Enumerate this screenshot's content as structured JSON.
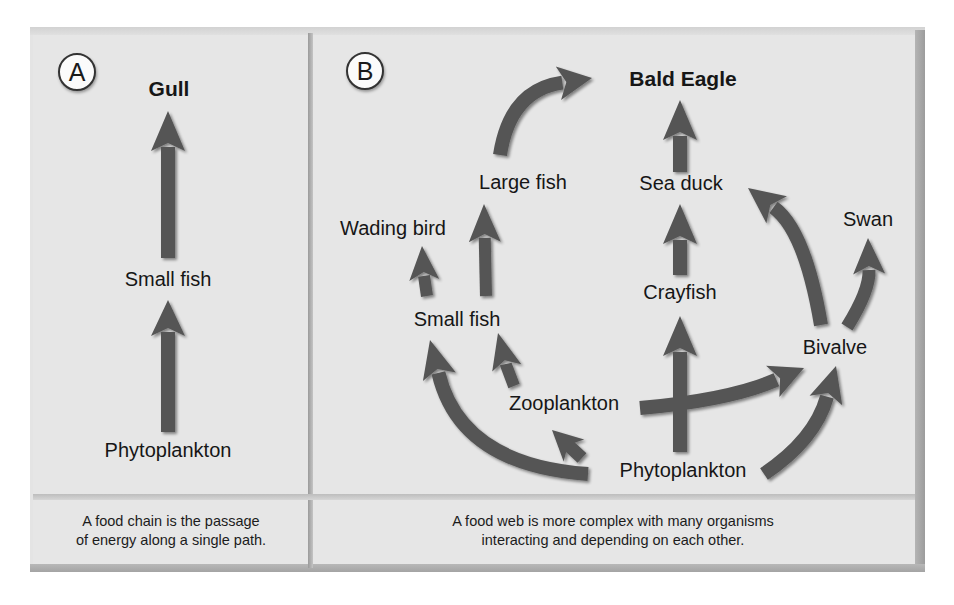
{
  "figure": {
    "panel_a": {
      "badge": "A",
      "top_consumer": "Gull",
      "nodes": [
        "Gull",
        "Small fish",
        "Phytoplankton"
      ],
      "links": [
        {
          "from": "Phytoplankton",
          "to": "Small fish"
        },
        {
          "from": "Small fish",
          "to": "Gull"
        }
      ],
      "caption_line1": "A food chain is the passage",
      "caption_line2": "of energy along a single path."
    },
    "panel_b": {
      "badge": "B",
      "nodes": {
        "bald_eagle": "Bald Eagle",
        "large_fish": "Large fish",
        "sea_duck": "Sea duck",
        "wading_bird": "Wading bird",
        "swan": "Swan",
        "crayfish": "Crayfish",
        "small_fish": "Small fish",
        "bivalve": "Bivalve",
        "zooplankton": "Zooplankton",
        "phytoplankton": "Phytoplankton"
      },
      "links": [
        {
          "from": "Large fish",
          "to": "Bald Eagle"
        },
        {
          "from": "Sea duck",
          "to": "Bald Eagle"
        },
        {
          "from": "Small fish",
          "to": "Large fish"
        },
        {
          "from": "Small fish",
          "to": "Wading bird"
        },
        {
          "from": "Crayfish",
          "to": "Sea duck"
        },
        {
          "from": "Bivalve",
          "to": "Sea duck"
        },
        {
          "from": "Bivalve",
          "to": "Swan"
        },
        {
          "from": "Zooplankton",
          "to": "Small fish"
        },
        {
          "from": "Zooplankton",
          "to": "Bivalve"
        },
        {
          "from": "Phytoplankton",
          "to": "Crayfish"
        },
        {
          "from": "Phytoplankton",
          "to": "Small fish"
        },
        {
          "from": "Phytoplankton",
          "to": "Zooplankton"
        },
        {
          "from": "Phytoplankton",
          "to": "Bivalve"
        }
      ],
      "caption_line1": "A food web is more complex with many organisms",
      "caption_line2": "interacting and depending on each other."
    },
    "colors": {
      "arrow": "#555555",
      "panel": "#e6e6e6",
      "text": "#161616"
    }
  }
}
